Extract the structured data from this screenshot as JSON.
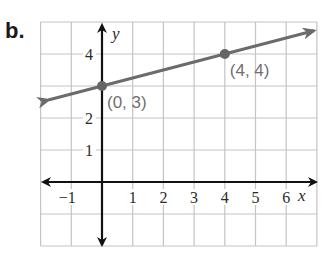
{
  "problem": {
    "label": "b."
  },
  "chart_data": {
    "type": "line",
    "title": "",
    "xlabel": "x",
    "ylabel": "y",
    "xlim": [
      -2,
      7
    ],
    "ylim": [
      -2,
      5
    ],
    "grid": true,
    "x_ticks": [
      "−1",
      "1",
      "2",
      "3",
      "4",
      "5",
      "6"
    ],
    "x_tick_values": [
      -1,
      1,
      2,
      3,
      4,
      5,
      6
    ],
    "y_ticks": [
      "4",
      "2",
      "1"
    ],
    "y_tick_values": [
      4,
      2,
      1
    ],
    "series": [
      {
        "name": "line",
        "equation": "y = x/4 + 3",
        "points": [
          {
            "x": 0,
            "y": 3,
            "label": "(0, 3)"
          },
          {
            "x": 4,
            "y": 4,
            "label": "(4, 4)"
          }
        ],
        "color": "#6b6b6b",
        "arrows": "both"
      }
    ],
    "colors": {
      "grid": "#c4c4c4",
      "axes": "#111111",
      "line": "#6b6b6b",
      "point_label": "#707070"
    }
  }
}
